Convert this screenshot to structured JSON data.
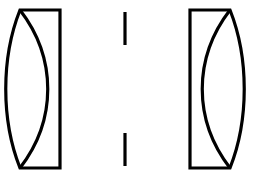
{
  "figure": {
    "kind": "optical-diagram",
    "background_color": "#ffffff",
    "stroke_color": "#000000",
    "stroke_width": 3.2,
    "canvas": {
      "width": 259,
      "height": 176
    }
  },
  "elements": {
    "left_group": {
      "name": "Left cemented doublet lens group",
      "orientation": "flat-side-right",
      "rect_left_x": 20,
      "rect_right_x": 60,
      "top_y": 10,
      "bottom_y": 168,
      "outer_curve_apex_x": 9,
      "inner_curve_apex_x": 48,
      "body_path": "M 20 10 L 60 10 L 60 168 L 20 168 C 1 120 1 58 20 10 Z",
      "cement_path": "M 20 10 C 57 58 57 120 20 168"
    },
    "right_group": {
      "name": "Right cemented doublet lens group",
      "orientation": "flat-side-left",
      "rect_left_x": 190,
      "rect_right_x": 230,
      "top_y": 10,
      "bottom_y": 168,
      "outer_curve_apex_x": 243,
      "inner_curve_apex_x": 202,
      "body_path": "M 230 10 L 190 10 L 190 168 L 230 168 C 249 120 249 58 230 10 Z",
      "cement_path": "M 230 10 C 193 58 193 120 230 168"
    },
    "aperture_stop": {
      "name": "Central aperture stop",
      "x": 125,
      "upper_bar": {
        "y_start": 12,
        "y_end": 45
      },
      "lower_bar": {
        "y_start": 133,
        "y_end": 166
      },
      "gap_center_y": 89
    }
  }
}
